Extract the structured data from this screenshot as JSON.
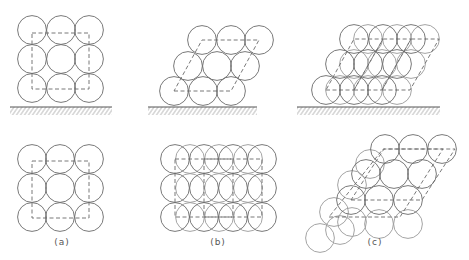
{
  "figure": {
    "radius": 14.4,
    "colors": {
      "stroke": "#6a6a6a",
      "back_stroke": "#9a9a9a",
      "background": "#ffffff"
    },
    "panels": [
      {
        "id": "a",
        "label": "(a)",
        "label_pos": [
          62,
          244
        ],
        "top": {
          "circles": [
            [
              32,
              30
            ],
            [
              61,
              30
            ],
            [
              89,
              30
            ],
            [
              32,
              59
            ],
            [
              61,
              59
            ],
            [
              89,
              59
            ],
            [
              32,
              88
            ],
            [
              61,
              88
            ],
            [
              89,
              88
            ]
          ],
          "back_circles": [],
          "cells": [
            [
              [
                32,
                33
              ],
              [
                89,
                33
              ],
              [
                89,
                89
              ],
              [
                32,
                89
              ]
            ]
          ],
          "ground": {
            "x1": 10,
            "x2": 112,
            "y": 107
          }
        },
        "bottom": {
          "circles": [
            [
              32,
              159
            ],
            [
              60,
              159
            ],
            [
              89,
              159
            ],
            [
              32,
              188
            ],
            [
              60,
              188
            ],
            [
              89,
              188
            ],
            [
              32,
              217
            ],
            [
              60,
              217
            ],
            [
              89,
              217
            ]
          ],
          "back_circles": [],
          "cells": [
            [
              [
                32,
                161
              ],
              [
                89,
                161
              ],
              [
                89,
                218
              ],
              [
                32,
                218
              ]
            ]
          ]
        }
      },
      {
        "id": "b",
        "label": "(b)",
        "label_pos": [
          218,
          244
        ],
        "top": {
          "circles": [
            [
              174,
              91
            ],
            [
              203,
              91
            ],
            [
              231,
              91
            ],
            [
              188,
              66
            ],
            [
              217,
              66
            ],
            [
              245,
              66
            ],
            [
              202,
              40
            ],
            [
              231,
              40
            ],
            [
              259,
              40
            ]
          ],
          "back_circles": [],
          "cells": [
            [
              [
                174,
                91
              ],
              [
                231,
                91
              ],
              [
                259,
                40
              ],
              [
                202,
                40
              ]
            ]
          ],
          "ground": {
            "x1": 148,
            "x2": 257,
            "y": 107
          }
        },
        "bottom": {
          "circles": [
            [
              175,
              159
            ],
            [
              204,
              159
            ],
            [
              233,
              159
            ],
            [
              262,
              159
            ],
            [
              175,
              188
            ],
            [
              204,
              188
            ],
            [
              233,
              188
            ],
            [
              262,
              188
            ],
            [
              175,
              217
            ],
            [
              204,
              217
            ],
            [
              233,
              217
            ],
            [
              262,
              217
            ]
          ],
          "back_circles": [
            [
              190,
              159
            ],
            [
              219,
              159
            ],
            [
              248,
              159
            ],
            [
              190,
              188
            ],
            [
              219,
              188
            ],
            [
              248,
              188
            ],
            [
              190,
              217
            ],
            [
              219,
              217
            ],
            [
              248,
              217
            ]
          ],
          "cells": [
            [
              [
                175,
                159
              ],
              [
                233,
                159
              ],
              [
                233,
                217
              ],
              [
                175,
                217
              ]
            ],
            [
              [
                204,
                159
              ],
              [
                262,
                159
              ],
              [
                262,
                217
              ],
              [
                204,
                217
              ]
            ]
          ]
        }
      },
      {
        "id": "c",
        "label": "(c)",
        "label_pos": [
          375,
          244
        ],
        "top": {
          "circles": [
            [
              326,
              90
            ],
            [
              354,
              90
            ],
            [
              382,
              90
            ],
            [
              340,
              64
            ],
            [
              368,
              64
            ],
            [
              397,
              64
            ],
            [
              354,
              39
            ],
            [
              383,
              39
            ],
            [
              411,
              39
            ]
          ],
          "back_circles": [
            [
              340,
              90
            ],
            [
              368,
              90
            ],
            [
              397,
              90
            ],
            [
              354,
              64
            ],
            [
              382,
              64
            ],
            [
              411,
              64
            ],
            [
              368,
              39
            ],
            [
              397,
              39
            ],
            [
              425,
              39
            ]
          ],
          "cells": [
            [
              [
                326,
                90
              ],
              [
                354,
                90
              ],
              [
                383,
                39
              ],
              [
                354,
                39
              ]
            ],
            [
              [
                354,
                90
              ],
              [
                382,
                90
              ],
              [
                411,
                39
              ],
              [
                383,
                39
              ]
            ],
            [
              [
                382,
                90
              ],
              [
                410,
                90
              ],
              [
                439,
                39
              ],
              [
                411,
                39
              ]
            ]
          ],
          "ground": {
            "x1": 297,
            "x2": 440,
            "y": 107
          }
        },
        "bottom": {
          "circles": [
            [
              385,
              149
            ],
            [
              413,
              149
            ],
            [
              442,
              149
            ],
            [
              366,
              174
            ],
            [
              394,
              174
            ],
            [
              422,
              174
            ],
            [
              351,
              200
            ],
            [
              379,
              200
            ],
            [
              408,
              200
            ]
          ],
          "back_circles": [
            [
              370,
              164
            ],
            [
              352,
              185
            ],
            [
              334,
              212
            ],
            [
              352,
              222
            ],
            [
              379,
              224
            ],
            [
              408,
              224
            ],
            [
              340,
              230
            ],
            [
              320,
              238
            ]
          ],
          "cells": [
            [
              [
                329,
                217
              ],
              [
                400,
                217
              ],
              [
                443,
                149
              ],
              [
                383,
                149
              ]
            ],
            [
              [
                351,
                200
              ],
              [
                422,
                200
              ],
              [
                455,
                149
              ],
              [
                384,
                149
              ]
            ]
          ]
        }
      }
    ]
  }
}
